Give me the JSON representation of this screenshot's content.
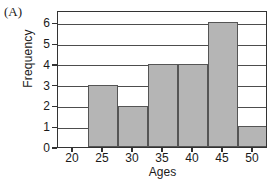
{
  "panel": {
    "label": "(A)"
  },
  "chart_data": {
    "type": "bar",
    "title": "",
    "xlabel": "Ages",
    "ylabel": "Frequency",
    "categories": [
      "20",
      "25",
      "30",
      "35",
      "40",
      "45",
      "50"
    ],
    "values": [
      0,
      3,
      2,
      4,
      4,
      6,
      1
    ],
    "bin_width": 5,
    "bin_edges": [
      "17.5",
      "22.5",
      "27.5",
      "32.5",
      "37.5",
      "42.5",
      "47.5",
      "52.5"
    ],
    "xlim": [
      17.5,
      52.5
    ],
    "ylim": [
      0,
      6.6
    ],
    "xticks": [
      "20",
      "25",
      "30",
      "35",
      "40",
      "45",
      "50"
    ],
    "yticks": [
      "0",
      "1",
      "2",
      "3",
      "4",
      "5",
      "6"
    ],
    "grid": "horizontal",
    "legend": "none",
    "bar_color": "#b5b5b5",
    "bar_edge_color": "#555555",
    "frame_color": "#333333"
  }
}
